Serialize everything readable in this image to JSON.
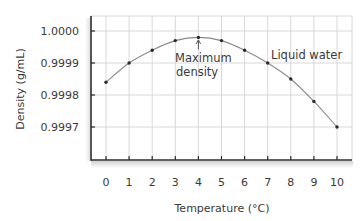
{
  "chart_data": {
    "type": "line",
    "title": "",
    "xlabel": "Temperature (°C)",
    "ylabel": "Density (g/mL)",
    "x": [
      0,
      1,
      2,
      3,
      4,
      5,
      6,
      7,
      8,
      9,
      10
    ],
    "series": [
      {
        "name": "Liquid water",
        "values": [
          0.99984,
          0.9999,
          0.99994,
          0.99997,
          0.99998,
          0.99997,
          0.99994,
          0.9999,
          0.99985,
          0.99978,
          0.9997
        ]
      }
    ],
    "x_ticks": [
      "0",
      "1",
      "2",
      "3",
      "4",
      "5",
      "6",
      "7",
      "8",
      "9",
      "10"
    ],
    "y_ticks": [
      "1.0000",
      "0.9999",
      "0.9998",
      "0.9997"
    ],
    "y_tick_values": [
      1.0,
      0.9999,
      0.9998,
      0.9997
    ],
    "xlim": [
      -0.65,
      10.65
    ],
    "ylim": [
      0.99961,
      1.00005
    ],
    "grid": true,
    "legend": "none",
    "annotations": [
      {
        "text": [
          "Maximum",
          "density"
        ],
        "x": 4,
        "y": 0.99998,
        "arrow": true
      },
      {
        "text": [
          "Liquid water"
        ],
        "x": 8.5,
        "y": 0.99991,
        "arrow": false
      }
    ],
    "colors": {
      "line": "#8a8a8a",
      "marker": "#2a2a2a",
      "grid": "#d8d8d8",
      "axis": "#2b2b2b",
      "text": "#3a3a3a"
    }
  }
}
